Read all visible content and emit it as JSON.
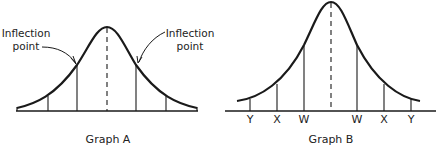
{
  "graph_a": {
    "caption": "Graph A",
    "annotation_left": {
      "line1": "Inflection",
      "line2": "point"
    },
    "annotation_right": {
      "line1": "Inflection",
      "line2": "point"
    }
  },
  "graph_b": {
    "caption": "Graph B",
    "tick_labels": [
      "Y",
      "X",
      "W",
      "W",
      "X",
      "Y"
    ]
  },
  "colors": {
    "ink": "#1a1a1a",
    "background": "#ffffff"
  }
}
